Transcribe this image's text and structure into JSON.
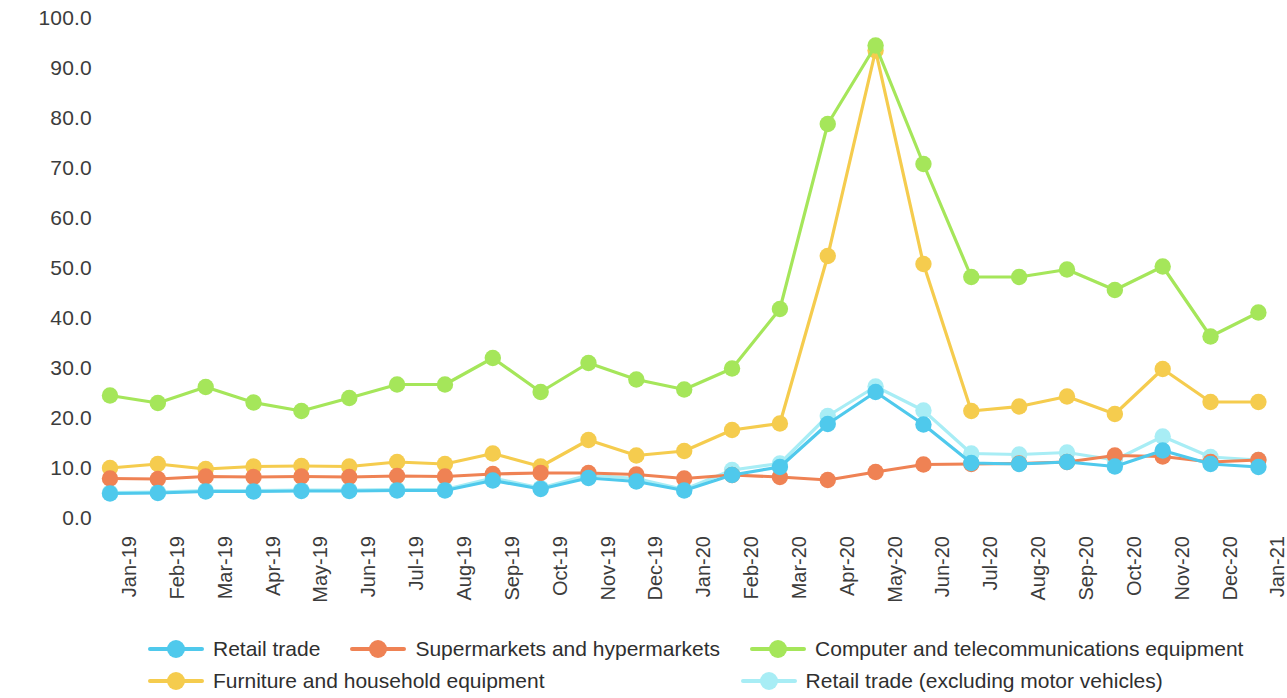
{
  "chart_data": {
    "type": "line",
    "title": "",
    "subtitle": "",
    "xlabel": "",
    "ylabel": "",
    "grid": false,
    "legend_position": "bottom",
    "ylim": [
      0.0,
      100.0
    ],
    "y_ticks": [
      "100.0",
      "90.0",
      "80.0",
      "70.0",
      "60.0",
      "50.0",
      "40.0",
      "30.0",
      "20.0",
      "10.0",
      "0.0"
    ],
    "y_tick_values": [
      100.0,
      90.0,
      80.0,
      70.0,
      60.0,
      50.0,
      40.0,
      30.0,
      20.0,
      10.0,
      0.0
    ],
    "categories": [
      "Jan-19",
      "Feb-19",
      "Mar-19",
      "Apr-19",
      "May-19",
      "Jun-19",
      "Jul-19",
      "Aug-19",
      "Sep-19",
      "Oct-19",
      "Nov-19",
      "Dec-19",
      "Jan-20",
      "Feb-20",
      "Mar-20",
      "Apr-20",
      "May-20",
      "Jun-20",
      "Jul-20",
      "Aug-20",
      "Sep-20",
      "Oct-20",
      "Nov-20",
      "Dec-20",
      "Jan-21"
    ],
    "series": [
      {
        "name": "Retail trade",
        "color": "#4FC9EC",
        "values": [
          4.9,
          5.0,
          5.3,
          5.3,
          5.4,
          5.4,
          5.5,
          5.5,
          7.5,
          5.8,
          8.0,
          7.3,
          5.5,
          8.6,
          10.2,
          18.8,
          25.2,
          18.7,
          11.0,
          10.8,
          11.2,
          10.3,
          13.5,
          10.8,
          10.2
        ]
      },
      {
        "name": "Supermarkets and hypermarkets",
        "color": "#EF8254",
        "values": [
          7.9,
          7.8,
          8.3,
          8.2,
          8.3,
          8.2,
          8.4,
          8.3,
          8.8,
          9.0,
          9.0,
          8.7,
          7.9,
          8.6,
          8.2,
          7.6,
          9.2,
          10.7,
          10.8,
          10.9,
          11.2,
          12.5,
          12.3,
          11.2,
          11.6
        ]
      },
      {
        "name": "Computer and telecommunications equipment",
        "color": "#A5E65A",
        "values": [
          24.5,
          23.0,
          26.2,
          23.1,
          21.4,
          24.0,
          26.7,
          26.7,
          32.0,
          25.2,
          31.0,
          27.7,
          25.7,
          29.9,
          41.8,
          78.8,
          94.5,
          70.8,
          48.2,
          48.2,
          49.7,
          45.6,
          50.3,
          36.3,
          41.1
        ]
      },
      {
        "name": "Furniture and household equipment",
        "color": "#F5CC4E",
        "values": [
          10.0,
          10.8,
          9.8,
          10.3,
          10.4,
          10.3,
          11.2,
          10.8,
          12.9,
          10.3,
          15.6,
          12.5,
          13.4,
          17.6,
          18.9,
          52.4,
          93.5,
          50.8,
          21.4,
          22.3,
          24.3,
          20.8,
          29.8,
          23.2,
          23.2
        ]
      },
      {
        "name": "Retail trade (excluding motor vehicles)",
        "color": "#A8EDF5",
        "values": [
          5.1,
          5.2,
          5.5,
          5.5,
          5.6,
          5.6,
          5.7,
          5.7,
          8.0,
          6.0,
          8.6,
          7.9,
          5.7,
          9.6,
          10.9,
          20.4,
          26.3,
          21.5,
          12.9,
          12.7,
          13.1,
          11.6,
          16.3,
          12.2,
          11.6
        ]
      }
    ]
  },
  "legend": {
    "rows": [
      [
        {
          "label": "Retail trade",
          "color": "#4FC9EC",
          "icon": "line-marker-icon"
        },
        {
          "label": "Supermarkets and hypermarkets",
          "color": "#EF8254",
          "icon": "line-marker-icon"
        },
        {
          "label": "Computer and telecommunications equipment",
          "color": "#A5E65A",
          "icon": "line-marker-icon"
        }
      ],
      [
        {
          "label": "Furniture and household equipment",
          "color": "#F5CC4E",
          "icon": "line-marker-icon"
        },
        {
          "label": "Retail trade (excluding motor vehicles)",
          "color": "#A8EDF5",
          "icon": "line-marker-icon"
        }
      ]
    ]
  }
}
